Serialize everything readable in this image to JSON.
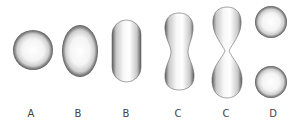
{
  "diagram": {
    "stages": [
      {
        "label": "A",
        "shape": "sphere"
      },
      {
        "label": "B",
        "shape": "ellipsoid"
      },
      {
        "label": "B",
        "shape": "elongated capsule"
      },
      {
        "label": "C",
        "shape": "pinching dumbbell"
      },
      {
        "label": "C",
        "shape": "figure-eight constriction"
      },
      {
        "label": "D",
        "shape": "two separate spheres"
      }
    ],
    "colors": {
      "edge": "#555555",
      "center": "#ffffff",
      "label": "#444444"
    }
  }
}
